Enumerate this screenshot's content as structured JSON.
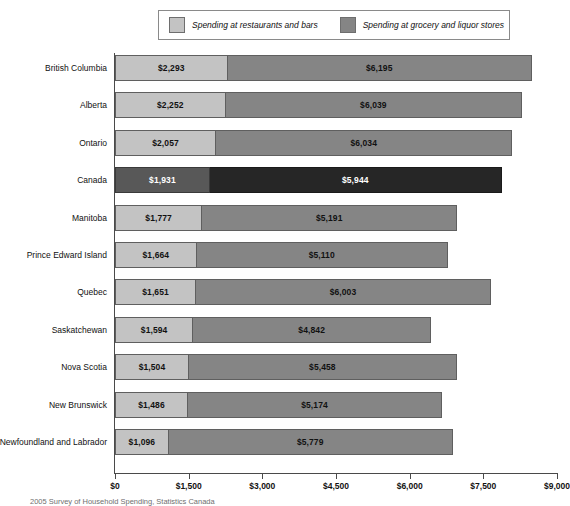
{
  "legend": {
    "entries": [
      {
        "label": "Spending at restaurants and bars",
        "color": "#c3c3c3",
        "swatch_name": "legend-swatch-restaurants"
      },
      {
        "label": "Spending at grocery and liquor stores",
        "color": "#858585",
        "swatch_name": "legend-swatch-grocery"
      }
    ]
  },
  "footnote": {
    "text": "2005 Survey of Household Spending, Statistics Canada"
  },
  "axis": {
    "x_ticks": [
      "$0",
      "$1,500",
      "$3,000",
      "$4,500",
      "$6,000",
      "$7,500",
      "$9,000"
    ],
    "x_tick_values": [
      0,
      1500,
      3000,
      4500,
      6000,
      7500,
      9000
    ],
    "x_min": 0,
    "x_max": 9000
  },
  "highlight": {
    "category": "Canada",
    "color_segment1": "#585858",
    "color_segment2": "#262626",
    "label_color": "#ffffff"
  },
  "chart_data": {
    "type": "bar",
    "orientation": "horizontal",
    "stacked": true,
    "title": "",
    "subtitle": "",
    "xlabel": "",
    "ylabel": "",
    "xlim": [
      0,
      9000
    ],
    "grid": false,
    "legend_position": "top",
    "categories": [
      "British Columbia",
      "Alberta",
      "Ontario",
      "Canada",
      "Manitoba",
      "Prince Edward Island",
      "Quebec",
      "Saskatchewan",
      "Nova Scotia",
      "New Brunswick",
      "Newfoundland and Labrador"
    ],
    "series": [
      {
        "name": "Spending at restaurants and bars",
        "values": [
          2293,
          2252,
          2057,
          1931,
          1777,
          1664,
          1651,
          1594,
          1504,
          1486,
          1096
        ],
        "labels": [
          "$2,293",
          "$2,252",
          "$2,057",
          "$1,931",
          "$1,777",
          "$1,664",
          "$1,651",
          "$1,594",
          "$1,504",
          "$1,486",
          "$1,096"
        ]
      },
      {
        "name": "Spending at grocery and liquor stores",
        "values": [
          6195,
          6039,
          6034,
          5944,
          5191,
          5110,
          6003,
          4842,
          5458,
          5174,
          5779
        ],
        "labels": [
          "$6,195",
          "$6,039",
          "$6,034",
          "$5,944",
          "$5,191",
          "$5,110",
          "$6,003",
          "$4,842",
          "$5,458",
          "$5,174",
          "$5,779"
        ]
      }
    ],
    "totals": [
      8488,
      8291,
      8091,
      7875,
      6968,
      6774,
      7654,
      6436,
      6962,
      6660,
      6875
    ]
  }
}
